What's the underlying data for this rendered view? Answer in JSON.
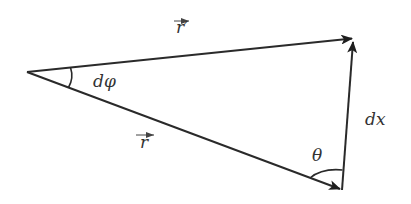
{
  "diagram": {
    "type": "vector-triangle",
    "stroke_color": "#2a2a2a",
    "background": "#ffffff",
    "vertices": {
      "origin": {
        "x": 27,
        "y": 72
      },
      "r_prime_tip": {
        "x": 355,
        "y": 38
      },
      "r_tip": {
        "x": 342,
        "y": 190
      }
    },
    "vectors": [
      {
        "name": "r",
        "from": "origin",
        "to": "r_tip"
      },
      {
        "name": "r_prime",
        "from": "origin",
        "to": "r_prime_tip"
      },
      {
        "name": "dx",
        "from": "r_tip",
        "to": "r_prime_tip"
      }
    ],
    "labels": {
      "r_prime": "r′",
      "r": "r",
      "d_phi": "dφ",
      "dx": "dx",
      "theta": "θ"
    }
  }
}
